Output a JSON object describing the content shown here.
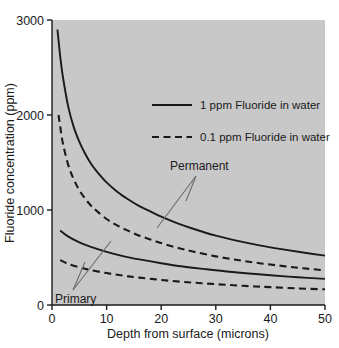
{
  "chart_data": {
    "type": "line",
    "title": "",
    "xlabel": "Depth from surface (microns)",
    "ylabel": "Fluoride concentration (ppm)",
    "xlim": [
      0,
      50
    ],
    "ylim": [
      0,
      3000
    ],
    "xticks": [
      "0",
      "10",
      "20",
      "30",
      "40",
      "50"
    ],
    "xtick_values": [
      0,
      10,
      20,
      30,
      40,
      50
    ],
    "yticks": [
      "0",
      "1000",
      "2000",
      "3000"
    ],
    "ytick_values": [
      0,
      1000,
      2000,
      3000
    ],
    "grid": false,
    "plot_background": "#c8c8c8",
    "line_color": "#1a1a1a",
    "legend": {
      "position": "upper-right-inside",
      "entries": [
        {
          "label": "1 ppm Fluoride in water",
          "style": "solid"
        },
        {
          "label": "0.1 ppm Fluoride in water",
          "style": "dashed"
        }
      ]
    },
    "annotations": [
      {
        "text": "Permanent",
        "x": 20.5,
        "y": 1440
      },
      {
        "text": "Primary",
        "x": 4.5,
        "y": 110
      }
    ],
    "series": [
      {
        "name": "Permanent - 1 ppm Fluoride in water",
        "group": "Permanent",
        "style": "solid",
        "x": [
          1.0,
          1.5,
          2,
          3,
          4,
          5,
          6,
          7,
          8,
          10,
          12,
          14,
          16,
          18,
          20,
          23,
          26,
          30,
          34,
          38,
          42,
          46,
          50
        ],
        "y": [
          2900,
          2620,
          2400,
          2080,
          1870,
          1720,
          1600,
          1500,
          1420,
          1290,
          1190,
          1110,
          1040,
          985,
          930,
          860,
          800,
          730,
          675,
          628,
          588,
          552,
          520
        ]
      },
      {
        "name": "Permanent - 0.1 ppm Fluoride in water",
        "group": "Permanent",
        "style": "dashed",
        "x": [
          1.2,
          1.5,
          2,
          3,
          4,
          5,
          6,
          7,
          8,
          10,
          12,
          14,
          16,
          18,
          20,
          23,
          26,
          30,
          34,
          38,
          42,
          46,
          50
        ],
        "y": [
          2000,
          1880,
          1700,
          1470,
          1320,
          1210,
          1125,
          1055,
          1000,
          905,
          835,
          780,
          730,
          690,
          652,
          602,
          560,
          512,
          473,
          440,
          412,
          387,
          365
        ]
      },
      {
        "name": "Primary - 1 ppm Fluoride in water",
        "group": "Primary",
        "style": "solid",
        "x": [
          1.5,
          3,
          5,
          7,
          10,
          13,
          16,
          20,
          24,
          28,
          32,
          36,
          40,
          45,
          50
        ],
        "y": [
          785,
          720,
          660,
          615,
          560,
          515,
          480,
          440,
          405,
          378,
          353,
          332,
          313,
          292,
          275
        ]
      },
      {
        "name": "Primary - 0.1 ppm Fluoride in water",
        "group": "Primary",
        "style": "dashed",
        "x": [
          1.5,
          3,
          5,
          7,
          10,
          13,
          16,
          20,
          24,
          28,
          32,
          36,
          40,
          45,
          50
        ],
        "y": [
          472,
          432,
          396,
          368,
          336,
          309,
          288,
          264,
          243,
          227,
          212,
          199,
          188,
          175,
          165
        ]
      }
    ]
  }
}
